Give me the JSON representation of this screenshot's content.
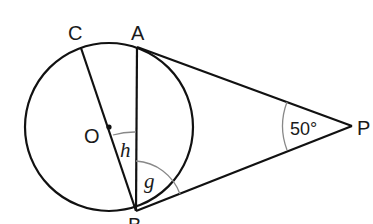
{
  "diagram": {
    "type": "geometry",
    "points": {
      "C": {
        "label": "C"
      },
      "A": {
        "label": "A"
      },
      "O": {
        "label": "O"
      },
      "B": {
        "label": "B"
      },
      "P": {
        "label": "P"
      }
    },
    "angles": {
      "P": {
        "label": "50°",
        "value_degrees": 50
      },
      "h": {
        "label": "h",
        "at": "B",
        "between": [
          "OB",
          "AB"
        ]
      },
      "g": {
        "label": "g",
        "at": "B",
        "between": [
          "AB",
          "PB"
        ]
      }
    },
    "colors": {
      "stroke": "#111111",
      "angle_arc": "#888888"
    }
  }
}
